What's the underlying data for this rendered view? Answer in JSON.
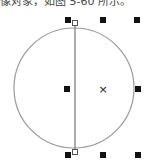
{
  "caption": {
    "text": "像对象，如图 5-60 所示。"
  },
  "figure": {
    "circle": {
      "cx": 74,
      "cy": 88,
      "r": 60,
      "stroke": "#999999"
    },
    "vertical_line": {
      "x": 75,
      "y1": 23,
      "y2": 150,
      "stroke": "#888888"
    },
    "center_marker": {
      "x": 103,
      "y": 89,
      "glyph": "×"
    },
    "handles": [
      {
        "id": "top-left",
        "x": 68,
        "y": 20
      },
      {
        "id": "top-center",
        "x": 103,
        "y": 20
      },
      {
        "id": "top-right",
        "x": 137,
        "y": 20
      },
      {
        "id": "middle-left",
        "x": 67,
        "y": 89
      },
      {
        "id": "middle-right",
        "x": 138,
        "y": 89
      },
      {
        "id": "bottom-left",
        "x": 68,
        "y": 155
      },
      {
        "id": "bottom-center",
        "x": 103,
        "y": 155
      },
      {
        "id": "bottom-right",
        "x": 138,
        "y": 155
      }
    ],
    "node_points": [
      {
        "id": "top-node",
        "x": 75,
        "y": 23
      },
      {
        "id": "bottom-node",
        "x": 75,
        "y": 152
      }
    ],
    "handle_color": "#111111"
  }
}
